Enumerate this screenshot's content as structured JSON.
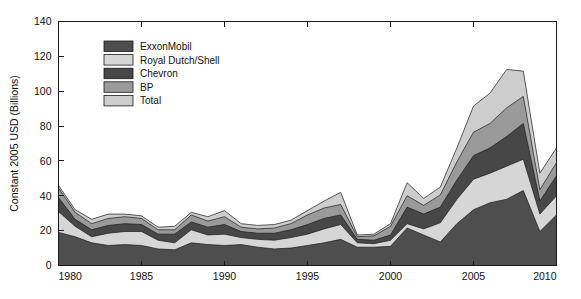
{
  "chart_data": {
    "type": "area",
    "stacked": true,
    "title": "",
    "subtitle": "",
    "xlabel": "",
    "ylabel": "Constant 2005 USD (Billions)",
    "xlim": [
      1980,
      2010
    ],
    "ylim": [
      0,
      140
    ],
    "ytick_labels": [
      "0",
      "20",
      "40",
      "60",
      "80",
      "100",
      "120",
      "140"
    ],
    "ytick_values": [
      0,
      20,
      40,
      60,
      80,
      100,
      120,
      140
    ],
    "xtick_labels": [
      "1980",
      "1985",
      "1990",
      "1995",
      "2000",
      "2005",
      "2010"
    ],
    "xtick_values": [
      1980,
      1985,
      1990,
      1995,
      2000,
      2005,
      2010
    ],
    "grid": false,
    "legend_position": "upper-left-inside",
    "x": [
      1980,
      1981,
      1982,
      1983,
      1984,
      1985,
      1986,
      1987,
      1988,
      1989,
      1990,
      1991,
      1992,
      1993,
      1994,
      1995,
      1996,
      1997,
      1998,
      1999,
      2000,
      2001,
      2002,
      2003,
      2004,
      2005,
      2006,
      2007,
      2008,
      2009,
      2010
    ],
    "series": [
      {
        "name": "ExxonMobil",
        "color": "#4e4e4e",
        "values": [
          19.0,
          16.5,
          13.0,
          11.5,
          12.0,
          11.5,
          9.5,
          9.0,
          13.0,
          12.0,
          11.5,
          12.0,
          10.5,
          9.5,
          10.0,
          11.5,
          13.0,
          15.0,
          10.5,
          10.5,
          11.0,
          21.5,
          17.5,
          13.5,
          24.0,
          32.0,
          36.0,
          38.0,
          43.0,
          19.5,
          29.0
        ]
      },
      {
        "name": "Royal Dutch/Shell",
        "color": "#d6d6d6",
        "values": [
          12.0,
          6.0,
          3.5,
          7.0,
          7.5,
          8.0,
          5.0,
          4.0,
          7.5,
          5.5,
          6.5,
          4.0,
          4.5,
          5.0,
          6.0,
          6.5,
          8.0,
          8.5,
          2.5,
          2.0,
          3.5,
          2.5,
          3.5,
          11.0,
          14.0,
          17.5,
          17.0,
          19.0,
          18.0,
          10.0,
          11.0
        ]
      },
      {
        "name": "Chevron",
        "color": "#474747",
        "values": [
          8.0,
          4.0,
          4.0,
          4.5,
          4.5,
          4.0,
          3.5,
          5.0,
          4.5,
          4.5,
          5.5,
          3.5,
          3.5,
          4.0,
          4.5,
          5.5,
          6.0,
          5.5,
          2.0,
          2.0,
          3.0,
          9.5,
          8.5,
          9.0,
          11.0,
          13.5,
          14.5,
          17.0,
          20.5,
          7.5,
          11.5
        ]
      },
      {
        "name": "BP",
        "color": "#9a9a9a",
        "values": [
          5.5,
          4.0,
          3.5,
          4.0,
          4.0,
          3.5,
          2.5,
          2.5,
          4.0,
          3.5,
          4.5,
          2.5,
          2.5,
          3.0,
          3.5,
          5.5,
          6.0,
          6.0,
          1.5,
          2.5,
          5.0,
          6.5,
          5.0,
          7.0,
          10.5,
          13.5,
          14.0,
          16.5,
          15.5,
          6.5,
          7.5
        ]
      },
      {
        "name": "Total",
        "color": "#cdcdcd",
        "values": [
          1.5,
          1.5,
          2.5,
          2.5,
          1.5,
          1.5,
          1.5,
          2.0,
          1.5,
          2.5,
          3.5,
          2.0,
          2.0,
          2.0,
          2.0,
          2.5,
          4.0,
          7.0,
          1.0,
          1.0,
          1.5,
          7.5,
          4.0,
          4.5,
          8.0,
          15.0,
          17.5,
          22.0,
          14.5,
          9.5,
          8.5
        ]
      }
    ]
  },
  "legend": {
    "entries": [
      {
        "label": "ExxonMobil"
      },
      {
        "label": "Royal Dutch/Shell"
      },
      {
        "label": "Chevron"
      },
      {
        "label": "BP"
      },
      {
        "label": "Total"
      }
    ]
  },
  "colors": {
    "axis": "#1a1a1a",
    "background": "#ffffff",
    "text": "#111111"
  }
}
